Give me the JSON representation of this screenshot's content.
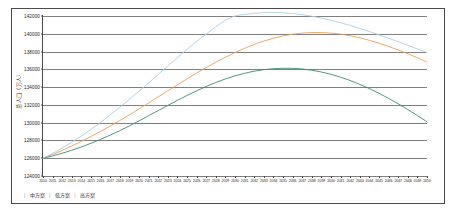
{
  "chart_data": {
    "type": "line",
    "title": "",
    "subtitle": "",
    "xlabel": "",
    "ylabel": "总人口（万人）",
    "ylim": [
      124000,
      142000
    ],
    "yticks": [
      124000,
      126000,
      128000,
      130000,
      132000,
      134000,
      136000,
      138000,
      140000,
      142000
    ],
    "ytick_labels": [
      "124000",
      "126000",
      "128000",
      "130000",
      "132000",
      "134000",
      "136000",
      "138000",
      "140000",
      "142000"
    ],
    "grid": true,
    "legend_position": "bottom-left",
    "x": [
      2010,
      2011,
      2012,
      2013,
      2014,
      2015,
      2016,
      2017,
      2018,
      2019,
      2020,
      2021,
      2022,
      2023,
      2024,
      2025,
      2026,
      2027,
      2028,
      2029,
      2030,
      2031,
      2032,
      2033,
      2034,
      2035,
      2036,
      2037,
      2038,
      2039,
      2040,
      2041,
      2042,
      2043,
      2044,
      2045,
      2046,
      2047,
      2048,
      2049,
      2050
    ],
    "xtick_labels": [
      "2010",
      "2011",
      "2012",
      "2013",
      "2014",
      "2015",
      "2016",
      "2017",
      "2018",
      "2019",
      "2020",
      "2021",
      "2022",
      "2023",
      "2024",
      "2025",
      "2026",
      "2027",
      "2028",
      "2029",
      "2030",
      "2031",
      "2032",
      "2033",
      "2034",
      "2035",
      "2036",
      "2037",
      "2038",
      "2039",
      "2040",
      "2041",
      "2042",
      "2043",
      "2044",
      "2045",
      "2046",
      "2047",
      "2048",
      "2049",
      "2050"
    ],
    "series": [
      {
        "name": "中方案",
        "color": "#e8a05a",
        "values": [
          126000,
          126420,
          126880,
          127380,
          127900,
          128450,
          129020,
          129620,
          130240,
          130880,
          131540,
          132220,
          132900,
          133580,
          134260,
          134930,
          135580,
          136200,
          136800,
          137360,
          137880,
          138360,
          138800,
          139180,
          139500,
          139760,
          139950,
          140080,
          140140,
          140140,
          140080,
          139960,
          139780,
          139540,
          139260,
          138940,
          138580,
          138180,
          137760,
          137300,
          136820
        ]
      },
      {
        "name": "低方案",
        "color": "#3f8a72",
        "values": [
          126000,
          126260,
          126560,
          126900,
          127270,
          127680,
          128120,
          128600,
          129100,
          129640,
          130200,
          130780,
          131360,
          131940,
          132510,
          133060,
          133580,
          134070,
          134520,
          134920,
          135270,
          135560,
          135790,
          135960,
          136070,
          136120,
          136110,
          136040,
          135900,
          135700,
          135440,
          135120,
          134740,
          134310,
          133830,
          133300,
          132730,
          132120,
          131480,
          130800,
          130100
        ]
      },
      {
        "name": "高方案",
        "color": "#a9cfe0",
        "values": [
          126000,
          126540,
          127140,
          127800,
          128500,
          129250,
          130040,
          130870,
          131730,
          132620,
          133540,
          134480,
          135430,
          136380,
          137320,
          138240,
          139130,
          139980,
          140780,
          141520,
          142000,
          142180,
          142300,
          142370,
          142390,
          142360,
          142280,
          142150,
          141980,
          141770,
          141520,
          141240,
          140930,
          140600,
          140250,
          139880,
          139500,
          139110,
          138710,
          138300,
          137880
        ]
      }
    ]
  },
  "legend": {
    "items": [
      "中方案",
      "低方案",
      "高方案"
    ],
    "separator": "|"
  }
}
